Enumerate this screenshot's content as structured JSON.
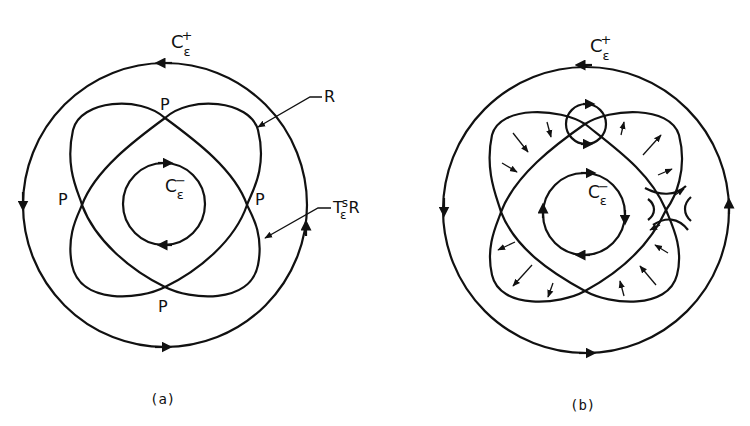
{
  "figure": {
    "panel_a": {
      "caption": "(a)",
      "outer_orbit": {
        "label": "C",
        "sub": "ε",
        "sup": "+"
      },
      "inner_orbit": {
        "label": "C",
        "sub": "ε",
        "sup": "−"
      },
      "intersection_label": "P",
      "region_label": "R",
      "image_label": {
        "base": "T",
        "sub": "ε",
        "sup": "s",
        "suffix": "R"
      }
    },
    "panel_b": {
      "caption": "(b)",
      "outer_orbit": {
        "label": "C",
        "sub": "ε",
        "sup": "+"
      },
      "inner_orbit": {
        "label": "C",
        "sub": "ε",
        "sup": "−"
      }
    }
  }
}
